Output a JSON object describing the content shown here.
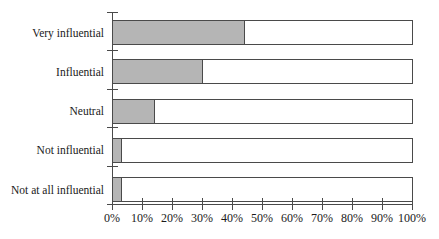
{
  "chart_data": {
    "type": "bar",
    "orientation": "horizontal",
    "title": "",
    "xlabel": "",
    "ylabel": "",
    "categories": [
      "Very influential",
      "Influential",
      "Neutral",
      "Not influential",
      "Not at all influential"
    ],
    "values": [
      44,
      30,
      14,
      3,
      3
    ],
    "unit": "%",
    "xlim": [
      0,
      100
    ],
    "x_tick_values": [
      0,
      10,
      20,
      30,
      40,
      50,
      60,
      70,
      80,
      90,
      100
    ],
    "x_tick_labels": [
      "0%",
      "10%",
      "20%",
      "30%",
      "40%",
      "50%",
      "60%",
      "70%",
      "80%",
      "90%",
      "100%"
    ],
    "grid": false,
    "legend": false,
    "colors": {
      "bar_fill": "#b5b5b5",
      "bar_background": "#ffffff",
      "bar_border": "#4a4a4a",
      "axis": "#4a4a4a",
      "text": "#1a1a1a"
    }
  }
}
